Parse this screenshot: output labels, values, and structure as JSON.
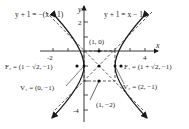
{
  "figure": {
    "type": "hyperbola",
    "equation": "(x-1)^2 - (y+1)^2 = 1",
    "center": [
      1,
      -1
    ],
    "colors": {
      "curve": "#1a1a1a",
      "asymptote": "#333333",
      "axis": "#222222"
    }
  },
  "axes": {
    "x_label": "x",
    "y_label": "y",
    "x_ticks": [
      "-2",
      "4"
    ],
    "y_ticks": [
      "2",
      "-4"
    ]
  },
  "asymptotes": {
    "left": "y + 1 = −(x − 1)",
    "right": "y + 1 = x − 1"
  },
  "points": {
    "point_1_0": "(1, 0)",
    "point_1_m2": "(1, −2)",
    "focus_2": "F₂ = (1 − √2, −1)",
    "focus_1": "F₁ = (1 + √2, −1)",
    "vertex_1": "V₁ = (0, −1)",
    "vertex_2": "V₂ = (2, −1)"
  }
}
